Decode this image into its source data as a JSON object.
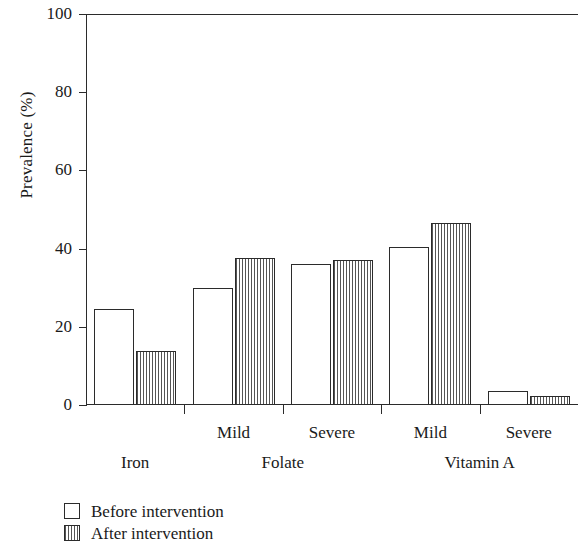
{
  "chart_data": {
    "type": "bar",
    "title": "",
    "xlabel": "",
    "ylabel": "Prevalence (%)",
    "ylim": [
      0,
      100
    ],
    "yticks": [
      0,
      20,
      40,
      60,
      80,
      100
    ],
    "ytick_labels": [
      "0",
      "20",
      "40",
      "60",
      "80",
      "100"
    ],
    "grid": false,
    "legend_position": "below-left",
    "categories": [
      "",
      "Mild",
      "Severe",
      "Mild",
      "Severe"
    ],
    "groups": [
      {
        "label": "Iron",
        "categories": [
          ""
        ]
      },
      {
        "label": "Folate",
        "categories": [
          "Mild",
          "Severe"
        ]
      },
      {
        "label": "Vitamin A",
        "categories": [
          "Mild",
          "Severe"
        ]
      }
    ],
    "series": [
      {
        "name": "Before intervention",
        "fill": "white",
        "pattern": "solid",
        "values": [
          24.5,
          30.0,
          36.0,
          40.5,
          3.5
        ]
      },
      {
        "name": "After intervention",
        "fill": "white",
        "pattern": "vertical-hatch",
        "values": [
          13.8,
          37.5,
          37.0,
          46.5,
          2.3
        ]
      }
    ]
  },
  "legend": {
    "items": [
      {
        "label": "Before intervention",
        "swatch": "open-square-icon"
      },
      {
        "label": "After intervention",
        "swatch": "hatched-square-icon"
      }
    ]
  },
  "colors": {
    "axis": "#2b2b2b",
    "text": "#1a1a1a",
    "bar_fill": "#ffffff",
    "hatch_line": "#555555",
    "background": "#ffffff"
  }
}
